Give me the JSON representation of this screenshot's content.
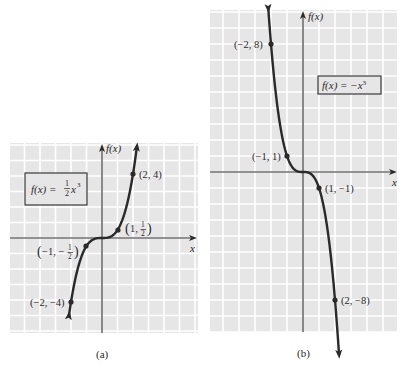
{
  "figure": {
    "panels": [
      {
        "id": "a",
        "caption": "(a)",
        "function_label": "f(x) = ½x³",
        "equation_parts": {
          "lhs": "f(x) = ",
          "num": "1",
          "den": "2",
          "var": "x",
          "exp": "3"
        },
        "x_axis_label": "x",
        "y_axis_label": "f(x)",
        "points": [
          {
            "label": "(2, 4)",
            "x": 2,
            "y": 4
          },
          {
            "label": "(1, 1/2)",
            "x": 1,
            "y": 0.5
          },
          {
            "label": "(−1, −1/2)",
            "x": -1,
            "y": -0.5
          },
          {
            "label": "(−2, −4)",
            "x": -2,
            "y": -4
          }
        ]
      },
      {
        "id": "b",
        "caption": "(b)",
        "function_label": "f(x) = −x³",
        "x_axis_label": "x",
        "y_axis_label": "f(x)",
        "points": [
          {
            "label": "(−2, 8)",
            "x": -2,
            "y": 8
          },
          {
            "label": "(−1, 1)",
            "x": -1,
            "y": 1
          },
          {
            "label": "(1, −1)",
            "x": 1,
            "y": -1
          },
          {
            "label": "(2, −8)",
            "x": 2,
            "y": -8
          }
        ]
      }
    ]
  },
  "chart_data": [
    {
      "type": "line",
      "title": "f(x) = (1/2)x^3",
      "xlabel": "x",
      "ylabel": "f(x)",
      "x": [
        -2,
        -1,
        0,
        1,
        2
      ],
      "series": [
        {
          "name": "f(x) = (1/2)x^3",
          "values": [
            -4,
            -0.5,
            0,
            0.5,
            4
          ]
        }
      ],
      "annotations": [
        "(2, 4)",
        "(1, 1/2)",
        "(−1, −1/2)",
        "(−2, −4)"
      ],
      "grid": true,
      "caption": "(a)"
    },
    {
      "type": "line",
      "title": "f(x) = −x^3",
      "xlabel": "x",
      "ylabel": "f(x)",
      "x": [
        -2,
        -1,
        0,
        1,
        2
      ],
      "series": [
        {
          "name": "f(x) = −x^3",
          "values": [
            8,
            1,
            0,
            -1,
            -8
          ]
        }
      ],
      "annotations": [
        "(−2, 8)",
        "(−1, 1)",
        "(1, −1)",
        "(2, −8)"
      ],
      "grid": true,
      "caption": "(b)"
    }
  ]
}
